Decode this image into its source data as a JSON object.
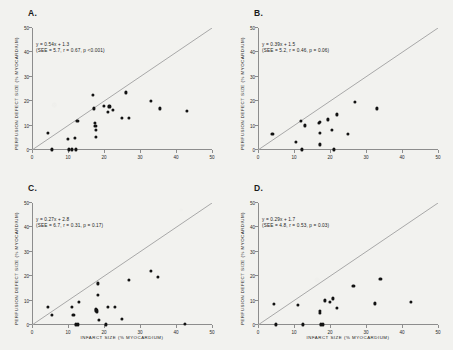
{
  "figure": {
    "background_color": "#f2f2ef",
    "dot_color": "#121212",
    "line_color": "#a8a8a8",
    "axis_color": "#8d8d8d"
  },
  "axes": {
    "xlabel": "INFARCT SIZE (% MYOCARDIUM)",
    "ylabel": "PERFUSION DEFECT SIZE (% MYOCARDIUM)",
    "xticks": [
      "0",
      "10",
      "20",
      "30",
      "40",
      "50"
    ],
    "yticks": [
      "0",
      "10",
      "20",
      "30",
      "40",
      "50"
    ],
    "xlim": [
      0,
      50
    ],
    "ylim": [
      0,
      50
    ]
  },
  "chart_data": [
    {
      "type": "scatter",
      "panel": "A",
      "panel_label": "A.",
      "title": "",
      "xlabel": "INFARCT SIZE (% MYOCARDIUM)",
      "ylabel": "PERFUSION DEFECT SIZE (% MYOCARDIUM)",
      "xlim": [
        0,
        50
      ],
      "ylim": [
        0,
        50
      ],
      "grid": false,
      "legend": "none",
      "annotation_line1": "y = 0.54x + 1.3",
      "annotation_line2": "(SEE = 5.7, r = 0.67, p <0.001)",
      "regression": {
        "slope": 0.54,
        "intercept": 1.3,
        "see": 5.7,
        "r": 0.67,
        "p": "<0.001"
      },
      "identity_line": {
        "slope": 1,
        "intercept": 0
      },
      "points": [
        [
          4.5,
          6.8
        ],
        [
          5.5,
          0.2
        ],
        [
          10.0,
          4.5
        ],
        [
          10.3,
          0.2
        ],
        [
          11.0,
          0.2
        ],
        [
          12.0,
          5.0
        ],
        [
          12.3,
          0.2
        ],
        [
          12.6,
          12.0
        ],
        [
          17.0,
          22.5
        ],
        [
          17.2,
          17.0
        ],
        [
          17.5,
          10.9
        ],
        [
          17.6,
          9.8
        ],
        [
          17.7,
          8.2
        ],
        [
          17.8,
          5.2
        ],
        [
          20.0,
          18.0
        ],
        [
          21.5,
          17.8
        ],
        [
          21.0,
          15.5
        ],
        [
          22.5,
          16.3
        ],
        [
          25.0,
          13.0
        ],
        [
          26.0,
          23.5
        ],
        [
          27.0,
          13.2
        ],
        [
          33.0,
          20.0
        ],
        [
          35.5,
          17.0
        ],
        [
          43.0,
          16.0
        ]
      ]
    },
    {
      "type": "scatter",
      "panel": "B",
      "panel_label": "B.",
      "title": "",
      "xlabel": "INFARCT SIZE (% MYOCARDIUM)",
      "ylabel": "PERFUSION DEFECT SIZE (% MYOCARDIUM)",
      "xlim": [
        0,
        50
      ],
      "ylim": [
        0,
        50
      ],
      "grid": false,
      "legend": "none",
      "annotation_line1": "y = 0.39x + 1.5",
      "annotation_line2": "(SEE = 5.2, r = 0.46, p = 0.06)",
      "regression": {
        "slope": 0.39,
        "intercept": 1.5,
        "see": 5.2,
        "r": 0.46,
        "p": "0.06"
      },
      "identity_line": {
        "slope": 1,
        "intercept": 0
      },
      "points": [
        [
          4.0,
          6.6
        ],
        [
          10.5,
          3.3
        ],
        [
          12.0,
          11.8
        ],
        [
          12.3,
          0.2
        ],
        [
          13.0,
          10.0
        ],
        [
          17.0,
          11.0
        ],
        [
          17.1,
          11.5
        ],
        [
          17.2,
          7.0
        ],
        [
          17.3,
          2.2
        ],
        [
          19.5,
          12.5
        ],
        [
          20.5,
          8.0
        ],
        [
          21.0,
          0.2
        ],
        [
          22.0,
          14.5
        ],
        [
          25.0,
          6.5
        ],
        [
          27.0,
          19.8
        ],
        [
          33.0,
          17.0
        ]
      ]
    },
    {
      "type": "scatter",
      "panel": "C",
      "panel_label": "C.",
      "title": "",
      "xlabel": "INFARCT SIZE (% MYOCARDIUM)",
      "ylabel": "PERFUSION DEFECT SIZE (% MYOCARDIUM)",
      "xlim": [
        0,
        50
      ],
      "ylim": [
        0,
        50
      ],
      "grid": false,
      "legend": "none",
      "annotation_line1": "y = 0.27x + 2.8",
      "annotation_line2": "(SEE = 6.7, r = 0.31, p = 0.17)",
      "regression": {
        "slope": 0.27,
        "intercept": 2.8,
        "see": 6.7,
        "r": 0.31,
        "p": "0.17"
      },
      "identity_line": {
        "slope": 1,
        "intercept": 0
      },
      "points": [
        [
          4.5,
          7.5
        ],
        [
          5.5,
          4.2
        ],
        [
          11.0,
          7.2
        ],
        [
          11.5,
          4.2
        ],
        [
          12.3,
          0.2
        ],
        [
          12.8,
          0.2
        ],
        [
          13.0,
          9.3
        ],
        [
          17.7,
          6.5
        ],
        [
          17.9,
          5.9
        ],
        [
          18.0,
          5.3
        ],
        [
          18.2,
          12.2
        ],
        [
          18.3,
          17.0
        ],
        [
          18.5,
          1.9
        ],
        [
          20.5,
          0.2
        ],
        [
          21.0,
          7.5
        ],
        [
          23.0,
          7.5
        ],
        [
          25.0,
          2.3
        ],
        [
          27.0,
          18.3
        ],
        [
          33.0,
          22.0
        ],
        [
          35.0,
          19.8
        ],
        [
          42.5,
          0.3
        ]
      ]
    },
    {
      "type": "scatter",
      "panel": "D",
      "panel_label": "D.",
      "title": "",
      "xlabel": "INFARCT SIZE (% MYOCARDIUM)",
      "ylabel": "PERFUSION DEFECT SIZE (% MYOCARDIUM)",
      "xlim": [
        0,
        50
      ],
      "ylim": [
        0,
        50
      ],
      "grid": false,
      "legend": "none",
      "annotation_line1": "y = 0.29x + 1.7",
      "annotation_line2": "(SEE = 4.8, r = 0.53, p = 0.03)",
      "regression": {
        "slope": 0.29,
        "intercept": 1.7,
        "see": 4.8,
        "r": 0.53,
        "p": "0.03"
      },
      "identity_line": {
        "slope": 1,
        "intercept": 0
      },
      "points": [
        [
          4.5,
          8.5
        ],
        [
          5.0,
          0.2
        ],
        [
          11.0,
          8.0
        ],
        [
          12.5,
          0.2
        ],
        [
          17.2,
          5.0
        ],
        [
          17.3,
          5.8
        ],
        [
          17.5,
          0.2
        ],
        [
          18.0,
          0.2
        ],
        [
          18.5,
          10.0
        ],
        [
          20.0,
          9.5
        ],
        [
          20.8,
          10.8
        ],
        [
          22.0,
          6.8
        ],
        [
          26.5,
          15.8
        ],
        [
          32.5,
          8.8
        ],
        [
          34.0,
          18.8
        ],
        [
          42.5,
          9.5
        ]
      ]
    }
  ]
}
